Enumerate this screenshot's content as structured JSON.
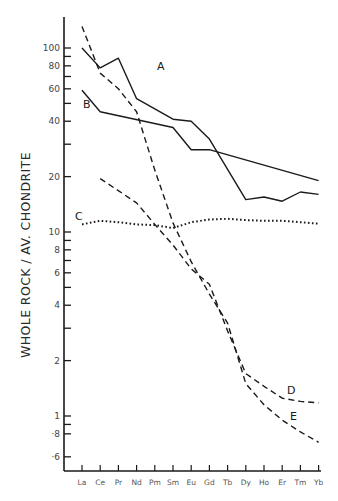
{
  "chart_data": {
    "type": "line",
    "title": "",
    "xlabel": "",
    "ylabel": "WHOLE ROCK / AV. CHONDRITE",
    "yscale": "log",
    "ylim": [
      0.58,
      160
    ],
    "grid": false,
    "legend": "inline labels at line ends (A, B, C, D, E)",
    "categories": [
      "La",
      "Ce",
      "Pr",
      "Nd",
      "Pm",
      "Sm",
      "Eu",
      "Gd",
      "Tb",
      "Dy",
      "Ho",
      "Er",
      "Tm",
      "Yb"
    ],
    "y_ticks": [
      {
        "value": 100,
        "label": "100"
      },
      {
        "value": 90,
        "label": ""
      },
      {
        "value": 80,
        "label": "80"
      },
      {
        "value": 70,
        "label": ""
      },
      {
        "value": 60,
        "label": "60"
      },
      {
        "value": 50,
        "label": ""
      },
      {
        "value": 40,
        "label": "40"
      },
      {
        "value": 30,
        "label": ""
      },
      {
        "value": 20,
        "label": "20"
      },
      {
        "value": 10,
        "label": "10"
      },
      {
        "value": 9,
        "label": ""
      },
      {
        "value": 8,
        "label": "8"
      },
      {
        "value": 7,
        "label": ""
      },
      {
        "value": 6,
        "label": "6"
      },
      {
        "value": 5,
        "label": ""
      },
      {
        "value": 4,
        "label": "4"
      },
      {
        "value": 3,
        "label": ""
      },
      {
        "value": 2,
        "label": "2"
      },
      {
        "value": 1,
        "label": "1"
      },
      {
        "value": 0.9,
        "label": ""
      },
      {
        "value": 0.8,
        "label": "·8"
      },
      {
        "value": 0.6,
        "label": "·6"
      }
    ],
    "series": [
      {
        "name": "A",
        "style": "solid",
        "points": [
          [
            "La",
            100
          ],
          [
            "Ce",
            78
          ],
          [
            "Pr",
            88
          ],
          [
            "Nd",
            53
          ],
          [
            "Sm",
            41
          ],
          [
            "Eu",
            40
          ],
          [
            "Gd",
            32
          ],
          [
            "Dy",
            15
          ],
          [
            "Ho",
            15.5
          ],
          [
            "Er",
            14.7
          ],
          [
            "Tm",
            16.5
          ],
          [
            "Yb",
            16
          ]
        ],
        "label_pos": {
          "x": 157,
          "y": 70
        }
      },
      {
        "name": "B",
        "style": "solid",
        "points": [
          [
            "La",
            59
          ],
          [
            "Ce",
            45
          ],
          [
            "Sm",
            37
          ],
          [
            "Eu",
            28
          ],
          [
            "Gd",
            28
          ],
          [
            "Yb",
            19
          ]
        ],
        "label_pos": {
          "x": 83,
          "y": 108
        }
      },
      {
        "name": "C",
        "style": "dotted",
        "points": [
          [
            "La",
            11
          ],
          [
            "Ce",
            11.5
          ],
          [
            "Pr",
            11.3
          ],
          [
            "Nd",
            11
          ],
          [
            "Pm",
            10.9
          ],
          [
            "Sm",
            10.5
          ],
          [
            "Eu",
            11.3
          ],
          [
            "Gd",
            11.7
          ],
          [
            "Tb",
            11.8
          ],
          [
            "Dy",
            11.6
          ],
          [
            "Ho",
            11.5
          ],
          [
            "Er",
            11.5
          ],
          [
            "Tm",
            11.3
          ],
          [
            "Yb",
            11.1
          ]
        ],
        "label_pos": {
          "x": 75,
          "y": 220
        }
      },
      {
        "name": "D",
        "style": "dashed",
        "points": [
          [
            "Ce",
            19.5
          ],
          [
            "Nd",
            14.4
          ],
          [
            "Pm",
            11
          ],
          [
            "Sm",
            8.5
          ],
          [
            "Eu",
            6.3
          ],
          [
            "Gd",
            5.2
          ],
          [
            "Tb",
            2.9
          ],
          [
            "Dy",
            1.7
          ],
          [
            "Ho",
            1.45
          ],
          [
            "Er",
            1.25
          ],
          [
            "Tm",
            1.2
          ],
          [
            "Yb",
            1.18
          ]
        ],
        "label_pos": {
          "x": 287,
          "y": 394
        }
      },
      {
        "name": "E",
        "style": "dashed",
        "points": [
          [
            "La",
            131
          ],
          [
            "Ce",
            73
          ],
          [
            "Pr",
            60
          ],
          [
            "Nd",
            45
          ],
          [
            "Pm",
            21.7
          ],
          [
            "Sm",
            11.2
          ],
          [
            "Eu",
            6.9
          ],
          [
            "Gd",
            4.6
          ],
          [
            "Tb",
            3.2
          ],
          [
            "Dy",
            1.5
          ],
          [
            "Ho",
            1.15
          ],
          [
            "Er",
            0.95
          ],
          [
            "Tm",
            0.82
          ],
          [
            "Yb",
            0.72
          ]
        ],
        "label_pos": {
          "x": 290,
          "y": 420
        }
      }
    ]
  }
}
